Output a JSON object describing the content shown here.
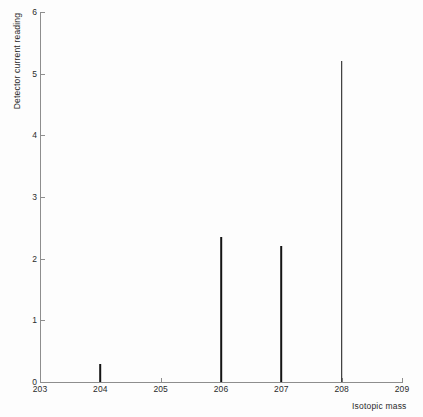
{
  "chart_data": {
    "type": "bar",
    "title": "",
    "subtitle": "",
    "xlabel": "Isotopic mass",
    "ylabel": "Detector current reading",
    "xlim": [
      203,
      209
    ],
    "ylim": [
      0,
      6
    ],
    "x_ticks": [
      203,
      204,
      205,
      206,
      207,
      208,
      209
    ],
    "x_tick_labels": [
      "203",
      "204",
      "205",
      "206",
      "207",
      "208",
      "209"
    ],
    "y_ticks": [
      0,
      1,
      2,
      3,
      4,
      5,
      6
    ],
    "y_tick_labels": [
      "0",
      "1",
      "2",
      "3",
      "4",
      "5",
      "6"
    ],
    "grid": false,
    "legend": null,
    "categories": [
      204,
      206,
      207,
      208
    ],
    "values": [
      0.3,
      2.35,
      2.2,
      5.2
    ],
    "points": [
      {
        "x": 204,
        "y": 0.3
      },
      {
        "x": 206,
        "y": 2.35
      },
      {
        "x": 207,
        "y": 2.2
      },
      {
        "x": 208,
        "y": 5.2
      }
    ],
    "annotations": [],
    "colors": {
      "background": "#fdfdfd",
      "axis": "#8e8e8e",
      "peak": "#141414",
      "text": "#2b2b2b"
    }
  }
}
